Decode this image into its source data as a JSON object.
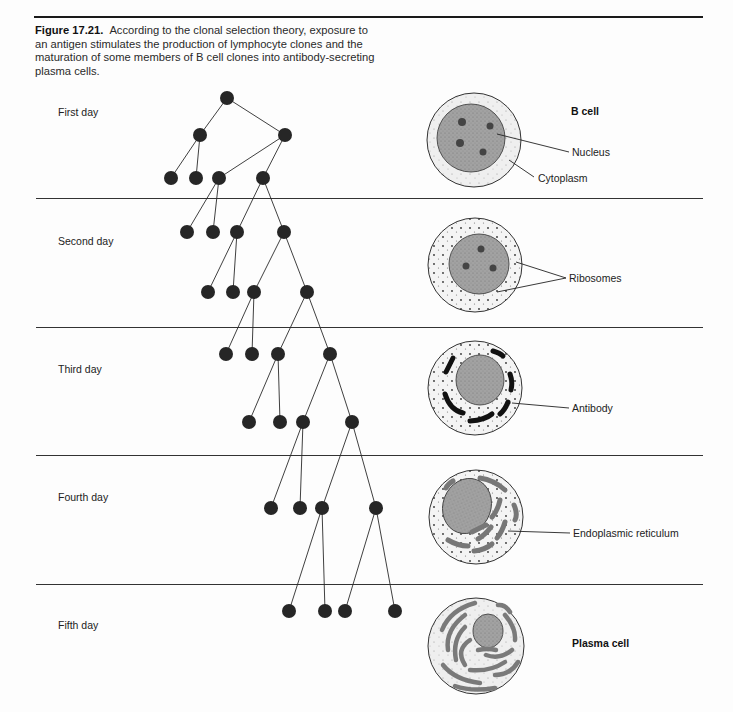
{
  "figure": {
    "number": "Figure 17.21.",
    "caption": "According to the clonal selection theory, exposure to an antigen stimulates the production of lymphocyte clones and the maturation of some members of B cell clones into antibody-secreting plasma cells."
  },
  "days": [
    {
      "label": "First day",
      "y": 112
    },
    {
      "label": "Second day",
      "y": 241
    },
    {
      "label": "Third day",
      "y": 369
    },
    {
      "label": "Fourth day",
      "y": 497
    },
    {
      "label": "Fifth day",
      "y": 625
    }
  ],
  "separators_y": [
    198,
    327,
    455,
    584
  ],
  "cell_labels": {
    "b_cell": "B cell",
    "nucleus": "Nucleus",
    "cytoplasm": "Cytoplasm",
    "ribosomes": "Ribosomes",
    "antibody": "Antibody",
    "endoplasmic_reticulum": "Endoplasmic reticulum",
    "plasma_cell": "Plasma cell"
  },
  "colors": {
    "ink": "#1a1a1a",
    "node": "#262626",
    "nucleus_fill": "#9a9a9a",
    "cytoplasm_fill": "#ececec",
    "er_fill": "#7d7d7d"
  }
}
